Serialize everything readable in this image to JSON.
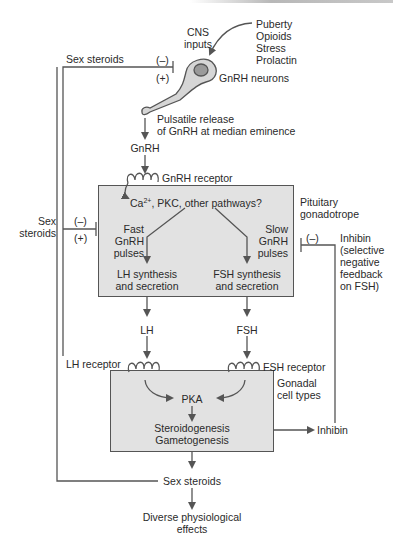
{
  "diagram": {
    "type": "hypothalamic-pituitary-gonadal axis",
    "colors": {
      "box_fill": "#e2e2e2",
      "line": "#555555",
      "text": "#2a2a2a",
      "neuron_fill": "#d6d6d6"
    },
    "hypothalamus": {
      "cns_inputs": [
        "CNS",
        "inputs"
      ],
      "modulators": [
        "Puberty",
        "Opioids",
        "Stress",
        "Prolactin"
      ],
      "neurons_label": "GnRH neurons",
      "release_label": [
        "Pulsatile release",
        "of GnRH at median eminence"
      ],
      "hormone": "GnRH"
    },
    "top_feedback": {
      "label": "Sex steroids",
      "neg": "(–)",
      "pos": "(+)"
    },
    "pituitary": {
      "receptor_label": "GnRH receptor",
      "box_label": [
        "Pituitary",
        "gonadotrope"
      ],
      "pathway_prefix": "Ca",
      "pathway_sup": "2+",
      "pathway_suffix": ", PKC, other pathways?",
      "fast_pulses": [
        "Fast",
        "GnRH",
        "pulses"
      ],
      "slow_pulses": [
        "Slow",
        "GnRH",
        "pulses"
      ],
      "lh_output": [
        "LH synthesis",
        "and secretion"
      ],
      "fsh_output": [
        "FSH synthesis",
        "and secretion"
      ]
    },
    "mid_feedback": {
      "label": [
        "Sex",
        "steroids"
      ],
      "neg": "(–)",
      "pos": "(+)"
    },
    "inhibin_feedback": {
      "neg": "(–)",
      "label": [
        "Inhibin",
        "(selective",
        "negative",
        "feedback",
        "on FSH)"
      ]
    },
    "hormones": {
      "lh": "LH",
      "fsh": "FSH"
    },
    "gonad": {
      "lh_receptor": "LH receptor",
      "fsh_receptor": "FSH receptor",
      "box_label": [
        "Gonadal",
        "cell types"
      ],
      "kinase": "PKA",
      "outputs": [
        "Steroidogenesis",
        "Gametogenesis"
      ],
      "inhibin_out": "Inhibin"
    },
    "bottom": {
      "sex_steroids": "Sex steroids",
      "effects": [
        "Diverse physiological",
        "effects"
      ]
    }
  }
}
